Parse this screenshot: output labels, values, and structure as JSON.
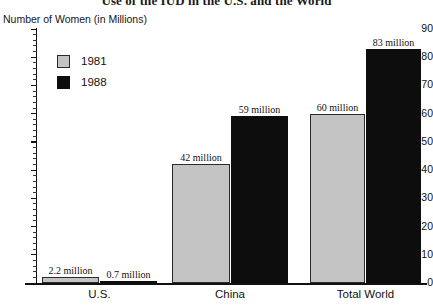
{
  "chart_data": {
    "type": "bar",
    "title": "Use of the IUD in the U.S. and the World",
    "xlabel": "",
    "ylabel": "Number of Women (in Millions)",
    "categories": [
      "U.S.",
      "China",
      "Total World"
    ],
    "series": [
      {
        "name": "1981",
        "color": "#c3c3c3",
        "values": [
          2.2,
          42,
          60
        ],
        "labels": [
          "2.2 million",
          "42 million",
          "60 million"
        ]
      },
      {
        "name": "1988",
        "color": "#0d0d0d",
        "values": [
          0.7,
          59,
          83
        ],
        "labels": [
          "0.7 million",
          "59 million",
          "83 million"
        ]
      }
    ],
    "ylim": [
      0,
      90
    ],
    "y_ticks": [
      0,
      10,
      20,
      30,
      40,
      50,
      60,
      70,
      80,
      90
    ],
    "y_tick_labels": [
      "0",
      "10",
      "20",
      "30",
      "40",
      "50",
      "60",
      "70",
      "80",
      "90"
    ],
    "y_minor_tick_step": 2,
    "grid": false,
    "legend_position": "upper-left-inside"
  },
  "axis": {
    "y_title": "Number of Women (in Millions)"
  },
  "legend": {
    "entries": [
      {
        "label": "1981",
        "color": "#c3c3c3"
      },
      {
        "label": "1988",
        "color": "#0d0d0d"
      }
    ]
  }
}
